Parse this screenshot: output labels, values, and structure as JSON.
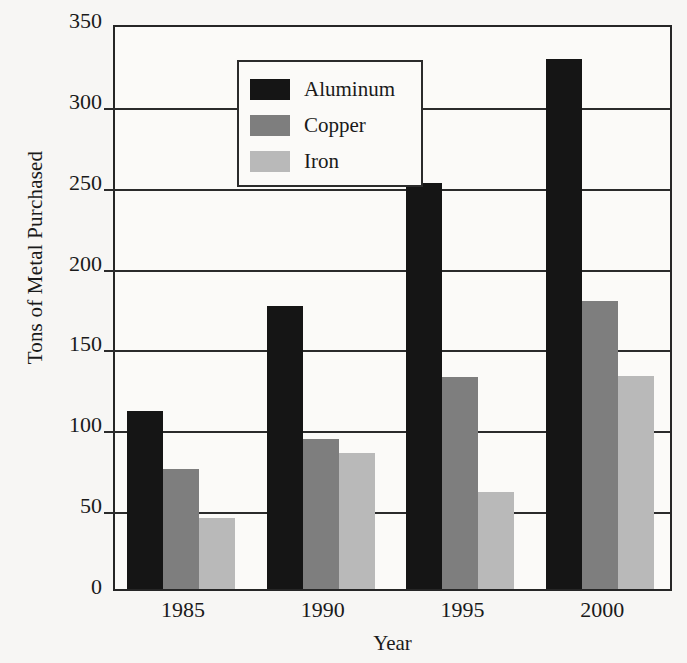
{
  "chart_data": {
    "type": "bar",
    "title": "",
    "xlabel": "Year",
    "ylabel": "Tons of Metal Purchased",
    "categories": [
      "1985",
      "1990",
      "1995",
      "2000"
    ],
    "series": [
      {
        "name": "Aluminum",
        "color": "#151515",
        "values": [
          110,
          175,
          251,
          328
        ]
      },
      {
        "name": "Copper",
        "color": "#7e7e7e",
        "values": [
          74,
          93,
          131,
          178
        ]
      },
      {
        "name": "Iron",
        "color": "#b9b9b9",
        "values": [
          44,
          84,
          60,
          132
        ]
      }
    ],
    "ylim": [
      0,
      350
    ],
    "yticks": [
      0,
      50,
      100,
      150,
      200,
      250,
      300,
      350
    ],
    "ytick_labels": [
      "0",
      "50",
      "100",
      "150",
      "200",
      "250",
      "300",
      "350"
    ],
    "grid": true,
    "grid_axis": "y",
    "legend_position": "top-left",
    "background_color": "#f7f6f4",
    "axis_color": "#262626"
  }
}
